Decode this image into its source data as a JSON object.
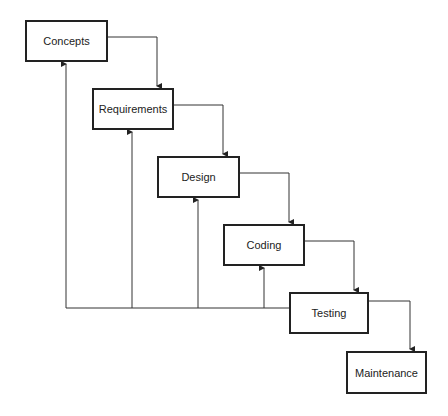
{
  "diagram": {
    "type": "waterfall-process",
    "stages": [
      {
        "id": "concepts",
        "label": "Concepts",
        "x": 25,
        "y": 20,
        "w": 83,
        "h": 42
      },
      {
        "id": "requirements",
        "label": "Requirements",
        "x": 92,
        "y": 88,
        "w": 82,
        "h": 42
      },
      {
        "id": "design",
        "label": "Design",
        "x": 157,
        "y": 156,
        "w": 83,
        "h": 42
      },
      {
        "id": "coding",
        "label": "Coding",
        "x": 223,
        "y": 224,
        "w": 82,
        "h": 42
      },
      {
        "id": "testing",
        "label": "Testing",
        "x": 289,
        "y": 292,
        "w": 80,
        "h": 42
      },
      {
        "id": "maintenance",
        "label": "Maintenance",
        "x": 346,
        "y": 351,
        "w": 81,
        "h": 43
      }
    ],
    "forward_edges": [
      {
        "from": "concepts",
        "to": "requirements"
      },
      {
        "from": "requirements",
        "to": "design"
      },
      {
        "from": "design",
        "to": "coding"
      },
      {
        "from": "coding",
        "to": "testing"
      },
      {
        "from": "testing",
        "to": "maintenance"
      }
    ],
    "feedback_edges": [
      {
        "from": "testing",
        "to": "concepts"
      },
      {
        "from": "testing",
        "to": "requirements"
      },
      {
        "from": "testing",
        "to": "design"
      },
      {
        "from": "testing",
        "to": "coding"
      }
    ],
    "colors": {
      "line": "#333333",
      "box_border": "#222222",
      "background": "#ffffff"
    }
  }
}
